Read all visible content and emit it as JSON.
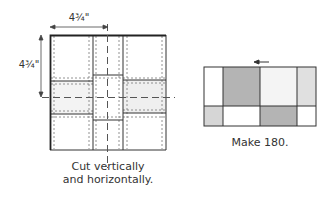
{
  "left_diagram": {
    "width_label": "4¾\"",
    "height_label": "4¾\"",
    "caption_line1": "Cut vertically",
    "caption_line2": "and horizontally."
  },
  "right_diagram": {
    "caption": "Make 180.",
    "arrow_direction": "left",
    "top_row": [
      {
        "fill": "#ffffff"
      },
      {
        "fill": "#b4b4b4"
      },
      {
        "fill": "#f4f4f4"
      },
      {
        "fill": "#e0e0e0"
      }
    ],
    "bottom_row": [
      {
        "fill": "#d6d6d6"
      },
      {
        "fill": "#ffffff"
      },
      {
        "fill": "#b4b4b4"
      },
      {
        "fill": "#ffffff"
      }
    ]
  },
  "colors": {
    "line": "#333333",
    "dashed": "#666666",
    "light_shade": "#f1f1f1"
  }
}
